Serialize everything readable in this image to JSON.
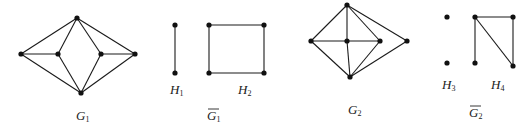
{
  "graphs": [
    {
      "id": "G1",
      "label": "G",
      "subscript": "1",
      "overline": false,
      "label_pos": [
        76,
        120
      ],
      "nodes": [
        [
          21,
          54
        ],
        [
          58,
          54
        ],
        [
          77,
          18
        ],
        [
          81,
          93
        ],
        [
          101,
          54
        ],
        [
          135,
          54
        ]
      ],
      "edges": [
        [
          0,
          2
        ],
        [
          0,
          1
        ],
        [
          0,
          3
        ],
        [
          1,
          2
        ],
        [
          1,
          3
        ],
        [
          2,
          4
        ],
        [
          2,
          5
        ],
        [
          4,
          5
        ],
        [
          4,
          3
        ],
        [
          5,
          3
        ]
      ]
    },
    {
      "id": "H1",
      "label": "H",
      "subscript": "1",
      "overline": false,
      "label_pos": [
        170,
        94
      ],
      "nodes": [
        [
          175,
          25
        ],
        [
          175,
          73
        ]
      ],
      "edges": [
        [
          0,
          1
        ]
      ]
    },
    {
      "id": "H2",
      "label": "H",
      "subscript": "2",
      "overline": false,
      "label_pos": [
        238,
        94
      ],
      "nodes": [
        [
          209,
          25
        ],
        [
          264,
          25
        ],
        [
          264,
          73
        ],
        [
          209,
          73
        ]
      ],
      "edges": [
        [
          0,
          1
        ],
        [
          1,
          2
        ],
        [
          2,
          3
        ],
        [
          3,
          0
        ]
      ]
    },
    {
      "id": "G1bar",
      "label": "G",
      "subscript": "1",
      "overline": true,
      "label_pos": [
        207,
        120
      ],
      "nodes": [],
      "edges": []
    },
    {
      "id": "G2",
      "label": "G",
      "subscript": "2",
      "overline": false,
      "label_pos": [
        348,
        114
      ],
      "nodes": [
        [
          347,
          5
        ],
        [
          311,
          41
        ],
        [
          347,
          41
        ],
        [
          380,
          41
        ],
        [
          407,
          41
        ],
        [
          350,
          77
        ]
      ],
      "edges": [
        [
          0,
          1
        ],
        [
          0,
          2
        ],
        [
          0,
          3
        ],
        [
          0,
          4
        ],
        [
          1,
          2
        ],
        [
          2,
          3
        ],
        [
          1,
          5
        ],
        [
          2,
          5
        ],
        [
          3,
          5
        ],
        [
          4,
          5
        ]
      ]
    },
    {
      "id": "H3",
      "label": "H",
      "subscript": "3",
      "overline": false,
      "label_pos": [
        442,
        89
      ],
      "nodes": [
        [
          447,
          17
        ],
        [
          447,
          63
        ]
      ],
      "edges": []
    },
    {
      "id": "H4",
      "label": "H",
      "subscript": "4",
      "overline": false,
      "label_pos": [
        491,
        89
      ],
      "nodes": [
        [
          475,
          17
        ],
        [
          513,
          17
        ],
        [
          475,
          63
        ],
        [
          513,
          66
        ]
      ],
      "edges": [
        [
          0,
          1
        ],
        [
          0,
          2
        ],
        [
          0,
          3
        ],
        [
          1,
          3
        ]
      ]
    },
    {
      "id": "G2bar",
      "label": "G",
      "subscript": "2",
      "overline": true,
      "label_pos": [
        469,
        117
      ],
      "nodes": [],
      "edges": []
    }
  ],
  "colors": {
    "line": "#1a1a1a",
    "node": "#111111",
    "text": "#222222",
    "background": "#ffffff"
  }
}
